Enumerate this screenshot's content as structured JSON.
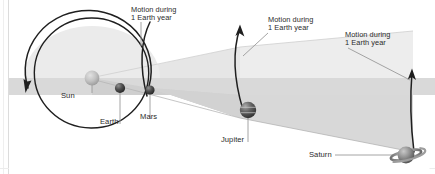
{
  "figure": {
    "background_color": "#ffffff",
    "frame_line_color": "#d9d9d9"
  },
  "colors": {
    "wedge_upper": "#e9e9e9",
    "wedge_lower": "#d6d6d6",
    "orbit_line": "#1f1f1f",
    "leader_line": "#8c8c8c",
    "label_text": "#2b2b2b",
    "sun_body": "#bdbdbd",
    "planet_body": "#4a4a4a",
    "saturn_body": "#8f8f8f"
  },
  "annotations": [
    {
      "id": "motion-mars",
      "line1": "Motion during",
      "line2": "1 Earth year"
    },
    {
      "id": "motion-jupiter",
      "line1": "Motion during",
      "line2": "1 Earth year"
    },
    {
      "id": "motion-saturn",
      "line1": "Motion during",
      "line2": "1 Earth year"
    }
  ],
  "bodies": [
    {
      "id": "sun",
      "label": "Sun"
    },
    {
      "id": "earth",
      "label": "Earth"
    },
    {
      "id": "mars",
      "label": "Mars"
    },
    {
      "id": "jupiter",
      "label": "Jupiter"
    },
    {
      "id": "saturn",
      "label": "Saturn"
    }
  ]
}
